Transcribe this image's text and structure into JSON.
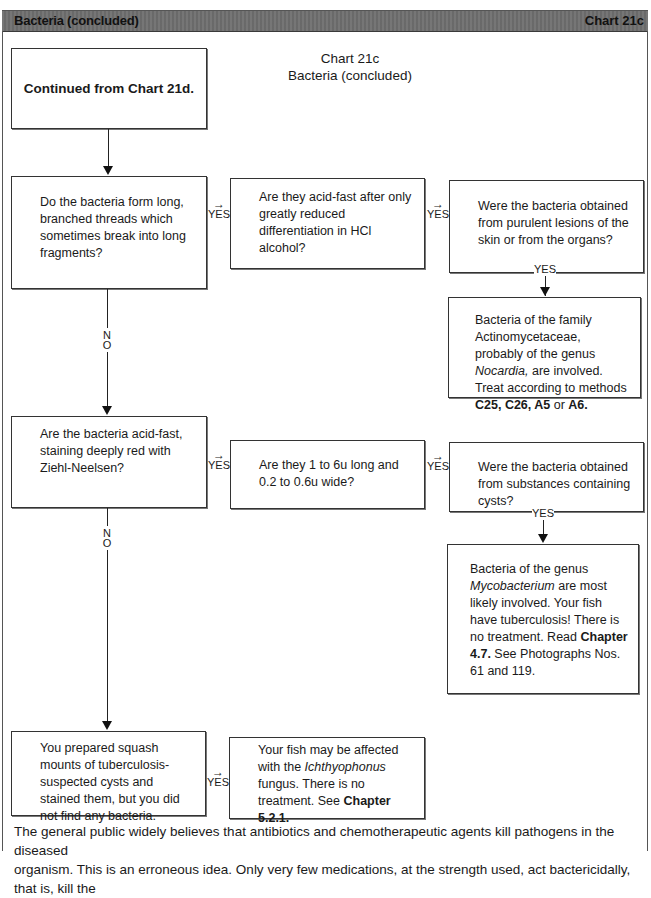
{
  "header": {
    "left_title": "Bacteria (concluded)",
    "right_title": "Chart 21c",
    "bar_color": "#6f6f6f"
  },
  "chart_title": {
    "line1": "Chart 21c",
    "line2": "Bacteria (concluded)"
  },
  "start": {
    "label": "Continued from Chart 21d."
  },
  "labels": {
    "yes": "YES",
    "no_n": "N",
    "no_o": "O",
    "right_arrow": "→"
  },
  "row1": {
    "q1": "Do the bacteria form long, branched threads which sometimes break into long fragments?",
    "q2": "Are they acid-fast after only greatly reduced differentiation in HCl alcohol?",
    "q3": "Were the bacteria obtained from purulent lesions of the skin or from the organs?",
    "result": {
      "t1": "Bacteria of the family Actinomycetaceae, probably of the genus ",
      "genus": "Nocardia,",
      "t2": " are involved. Treat according to methods ",
      "m1": "C25, C26, A5",
      "t3": " or ",
      "m2": "A6."
    }
  },
  "row2": {
    "q1": "Are the bacteria acid-fast, staining deeply red with Ziehl-Neelsen?",
    "q2": "Are they 1 to 6u long and 0.2 to 0.6u wide?",
    "q3": "Were the bacteria obtained from substances containing cysts?",
    "result": {
      "t1": "Bacteria of the genus ",
      "genus": "Mycobacterium",
      "t2": " are most likely involved. Your fish have tuberculosis! There is no treatment. Read ",
      "chapter": "Chapter 4.7.",
      "t3": " See Photographs Nos. 61 and 119."
    }
  },
  "row3": {
    "q1": "You prepared squash mounts of tuberculosis-suspected cysts and stained them, but you did not find any bacteria.",
    "result": {
      "t1": "Your fish may be affected with the ",
      "genus": "Ichthyophonus",
      "t2": " fungus. There is no treatment. See ",
      "chapter": "Chapter 5.2.1."
    }
  },
  "paragraph": {
    "line1": "The general public widely believes that antibiotics and chemotherapeutic agents kill pathogens in the diseased",
    "line2": "organism. This is an erroneous idea. Only very few medications, at the strength used, act bactericidally, that is, kill the"
  }
}
